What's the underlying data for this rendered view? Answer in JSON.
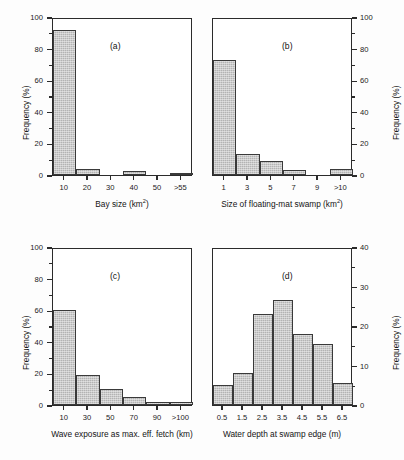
{
  "figure": {
    "background": "#fdfdfd",
    "bar_fill": "#b3b3b3",
    "bar_edge": "#3a3a3a",
    "axis_color": "#2b2b2b"
  },
  "chart_data": [
    {
      "type": "bar",
      "panel": "(a)",
      "title": "",
      "xlabel": "Bay size (km²)",
      "xlabel_base": "Bay size (km",
      "xlabel_sup": "2",
      "xlabel_tail": ")",
      "ylabel": "Frequency (%)",
      "categories": [
        "10",
        "20",
        "30",
        "40",
        "50",
        ">55"
      ],
      "values": [
        92,
        3.5,
        0,
        2.5,
        0,
        1
      ],
      "ylim": [
        0,
        100
      ],
      "yticks": [
        0,
        20,
        40,
        60,
        80,
        100
      ],
      "ytick_labels": [
        "0",
        "20",
        "40",
        "60",
        "80",
        "100"
      ],
      "yaxis_side": "left",
      "grid": false,
      "legend": "none"
    },
    {
      "type": "bar",
      "panel": "(b)",
      "title": "",
      "xlabel": "Size of floating-mat swamp (km²)",
      "xlabel_base": "Size of floating-mat swamp (km",
      "xlabel_sup": "2",
      "xlabel_tail": ")",
      "ylabel": "Frequency (%)",
      "categories": [
        "1",
        "3",
        "5",
        "7",
        "9",
        ">10"
      ],
      "values": [
        73,
        13,
        9,
        3,
        0,
        3.5
      ],
      "ylim": [
        0,
        100
      ],
      "yticks": [
        0,
        20,
        40,
        60,
        80,
        100
      ],
      "ytick_labels": [
        "0",
        "20",
        "40",
        "60",
        "80",
        "100"
      ],
      "yaxis_side": "right",
      "grid": false,
      "legend": "none"
    },
    {
      "type": "bar",
      "panel": "(c)",
      "title": "",
      "xlabel": "Wave exposure as max. eff. fetch (km)",
      "xlabel_base": "Wave exposure as max. eff. fetch (km)",
      "xlabel_sup": "",
      "xlabel_tail": "",
      "ylabel": "Frequency (%)",
      "categories": [
        "10",
        "30",
        "50",
        "70",
        "90",
        ">100"
      ],
      "values": [
        60,
        19,
        10,
        5,
        2,
        2
      ],
      "ylim": [
        0,
        100
      ],
      "yticks": [
        0,
        20,
        40,
        60,
        80,
        100
      ],
      "ytick_labels": [
        "0",
        "20",
        "40",
        "60",
        "80",
        "100"
      ],
      "yaxis_side": "left",
      "grid": false,
      "legend": "none"
    },
    {
      "type": "bar",
      "panel": "(d)",
      "title": "",
      "xlabel": "Water depth at swamp edge (m)",
      "xlabel_base": "Water depth at swamp edge (m)",
      "xlabel_sup": "",
      "xlabel_tail": "",
      "ylabel": "Frequency (%)",
      "categories": [
        "0.5",
        "1.5",
        "2.5",
        "3.5",
        "4.5",
        "5.5",
        "6.5"
      ],
      "values": [
        5,
        8,
        23,
        26.5,
        18,
        15.5,
        5.5
      ],
      "ylim": [
        0,
        40
      ],
      "yticks": [
        0,
        10,
        20,
        30,
        40
      ],
      "ytick_labels": [
        "0",
        "10",
        "20",
        "30",
        "40"
      ],
      "yaxis_side": "right",
      "grid": false,
      "legend": "none"
    }
  ]
}
